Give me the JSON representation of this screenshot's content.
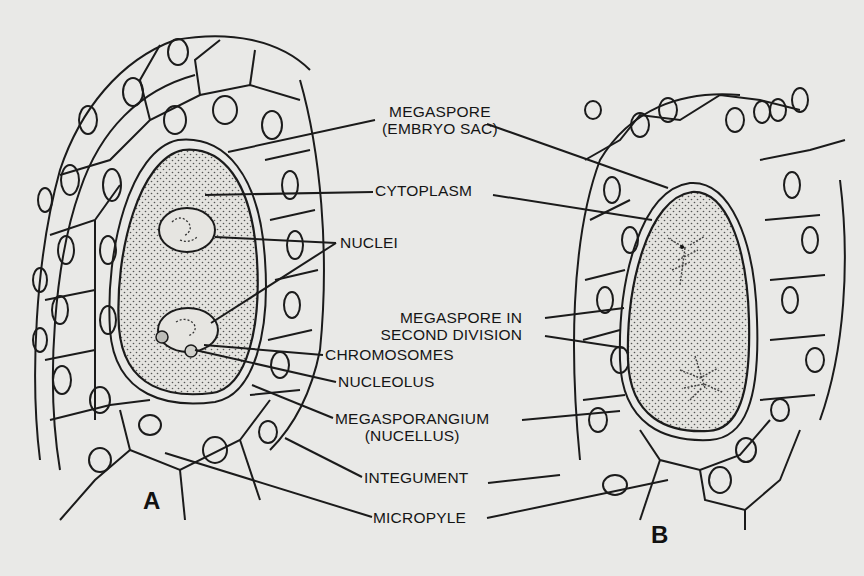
{
  "figure": {
    "panels": [
      {
        "id": "A",
        "letter": "A"
      },
      {
        "id": "B",
        "letter": "B"
      }
    ],
    "labels": {
      "megaspore_line1": "MEGASPORE",
      "megaspore_line2": "(EMBRYO SAC)",
      "cytoplasm": "CYTOPLASM",
      "nuclei": "NUCLEI",
      "megaspore_div_line1": "MEGASPORE IN",
      "megaspore_div_line2": "SECOND DIVISION",
      "chromosomes": "CHROMOSOMES",
      "nucleolus": "NUCLEOLUS",
      "megasporangium_line1": "MEGASPORANGIUM",
      "megasporangium_line2": "(NUCELLUS)",
      "integument": "INTEGUMENT",
      "micropyle": "MICROPYLE"
    },
    "colors": {
      "background": "#e9e9e7",
      "ink": "#1b1b1b"
    }
  }
}
